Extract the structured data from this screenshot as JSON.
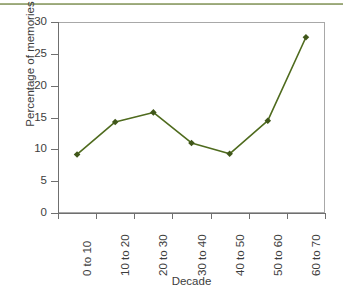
{
  "chart_data": {
    "type": "line",
    "title": "",
    "subtitle": "",
    "xlabel": "Decade",
    "ylabel": "Percentage of memories",
    "categories": [
      "0 to 10",
      "10 to 20",
      "20 to 30",
      "30 to 40",
      "40 to 50",
      "50 to 60",
      "60 to 70"
    ],
    "values": [
      9.2,
      14.3,
      15.8,
      11.0,
      9.3,
      14.5,
      27.6
    ],
    "series": [
      {
        "name": "Percentage of memories",
        "values": [
          9.2,
          14.3,
          15.8,
          11.0,
          9.3,
          14.5,
          27.6
        ]
      }
    ],
    "ylim": [
      0,
      30
    ],
    "yticks": [
      0,
      5,
      10,
      15,
      20,
      25,
      30
    ],
    "ytick_labels": [
      "0",
      "5",
      "10",
      "15",
      "20",
      "25",
      "30"
    ],
    "grid": false,
    "legend": false,
    "legend_position": "none",
    "annotations": [],
    "line_color": "#4f6b1e",
    "marker_color": "#40571a",
    "marker_shape": "diamond",
    "axis_color": "#6f6f6f",
    "frame_color": "#a8a8a8",
    "text_color": "#3d3d3d",
    "background_color": "#ffffff",
    "top_rule_color": "#7f9150"
  }
}
